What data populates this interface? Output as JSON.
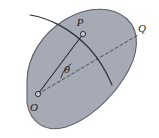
{
  "figure": {
    "name": "angle-theta-on-region-diagram",
    "type": "geometric-diagram",
    "width": 159,
    "height": 138,
    "background_color": "#ffffff"
  },
  "colors": {
    "region_fill": "#a5aab5",
    "region_stroke": "#5c606b",
    "curve_stroke": "#2e3138",
    "radius_stroke": "#2b2e35",
    "dashed_stroke": "#4a4d55",
    "label_color": "#1a1a1f",
    "marker_fill": "#c3c7d0",
    "marker_stroke": "#23262c"
  },
  "labels": {
    "point_p": "P",
    "point_o": "O",
    "point_q": "Q",
    "angle_theta": "θ"
  },
  "points": {
    "p": {
      "label": "P",
      "x": 83,
      "y": 34,
      "label_x": 80,
      "label_y": 26
    },
    "o": {
      "label": "O",
      "x": 38,
      "y": 94,
      "label_x": 34,
      "label_y": 111
    },
    "q": {
      "label": "Q",
      "x": 138,
      "y": 35,
      "label_x": 142,
      "label_y": 32
    }
  },
  "geometry": {
    "region_path": "M 27,81 C 27,58 42,33 66,19 C 88,6 113,6 127,19 C 141,32 139,55 124,78 C 110,100 88,120 66,127 C 45,133 30,122 27,103 Z",
    "curve_path": "M 30,15 C 50,18 72,30 89,48 C 100,60 107,73 112,85",
    "radius_path": "M 38,94 L 83,34",
    "dashed_path": "M 38,94 L 138,35",
    "arc_path": "M 61,78 A 22,22 0 0 1 71,64",
    "dash_pattern": "3,2.6",
    "marker_radius": 2.6
  },
  "description": {
    "title": "Point P on a curve within a planar region, with angle theta measured at O",
    "elements": [
      "shaded planar region",
      "curve through point P",
      "segment from O to P",
      "dashed ray from O toward Q",
      "angle theta between segment OP and ray OQ"
    ]
  }
}
